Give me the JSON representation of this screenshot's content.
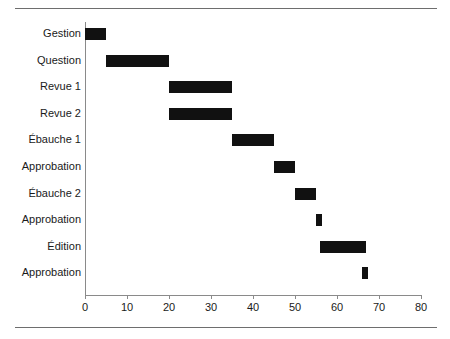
{
  "chart_data": {
    "type": "bar",
    "subtype": "gantt",
    "orientation": "horizontal",
    "title": "",
    "xlabel": "",
    "ylabel": "",
    "xlim": [
      0,
      80
    ],
    "xticks": [
      0,
      10,
      20,
      30,
      40,
      50,
      60,
      70,
      80
    ],
    "xtick_labels": [
      "0",
      "10",
      "20",
      "30",
      "40",
      "50",
      "60",
      "70",
      "80"
    ],
    "grid": false,
    "legend": null,
    "bar_color": "#111111",
    "axis_color": "#8a8a8a",
    "rule_color": "#6e6e6e",
    "categories": [
      "Gestion",
      "Question",
      "Revue 1",
      "Revue 2",
      "Ébauche 1",
      "Approbation",
      "Ébauche 2",
      "Approbation",
      "Édition",
      "Approbation"
    ],
    "tasks": [
      {
        "label": "Gestion",
        "start": 0,
        "end": 5,
        "duration": 5
      },
      {
        "label": "Question",
        "start": 5,
        "end": 20,
        "duration": 15
      },
      {
        "label": "Revue 1",
        "start": 20,
        "end": 35,
        "duration": 15
      },
      {
        "label": "Revue 2",
        "start": 20,
        "end": 35,
        "duration": 15
      },
      {
        "label": "Ébauche 1",
        "start": 35,
        "end": 45,
        "duration": 10
      },
      {
        "label": "Approbation",
        "start": 45,
        "end": 50,
        "duration": 5
      },
      {
        "label": "Ébauche 2",
        "start": 50,
        "end": 55,
        "duration": 5
      },
      {
        "label": "Approbation",
        "start": 55,
        "end": 56.5,
        "duration": 1.5
      },
      {
        "label": "Édition",
        "start": 56,
        "end": 67,
        "duration": 11
      },
      {
        "label": "Approbation",
        "start": 66,
        "end": 67.5,
        "duration": 1.5
      }
    ]
  }
}
